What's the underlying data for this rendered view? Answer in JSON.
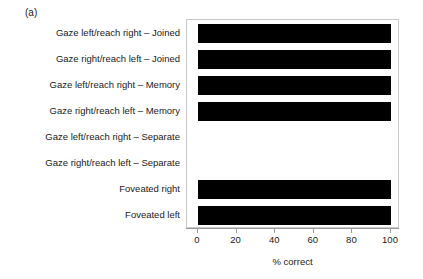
{
  "panel": {
    "label": "(a)"
  },
  "chart_data": {
    "type": "bar",
    "orientation": "horizontal",
    "title": "",
    "subtitle": "",
    "xlabel": "% correct",
    "ylabel": "",
    "xlim": [
      0,
      100
    ],
    "xticks": [
      0,
      20,
      40,
      60,
      80,
      100
    ],
    "xticklabels": [
      "0",
      "20",
      "40",
      "60",
      "80",
      "100"
    ],
    "grid": false,
    "legend": null,
    "bar_color": "#000000",
    "frame_color": "#c9c9c9",
    "axis_color": "#9a9a9a",
    "categories": [
      "Gaze left/reach right – Joined",
      "Gaze right/reach left – Joined",
      "Gaze left/reach right – Memory",
      "Gaze right/reach left – Memory",
      "Gaze left/reach right – Separate",
      "Gaze right/reach left – Separate",
      "Foveated right",
      "Foveated left"
    ],
    "values": [
      100,
      100,
      100,
      100,
      0,
      0,
      100,
      100
    ]
  }
}
